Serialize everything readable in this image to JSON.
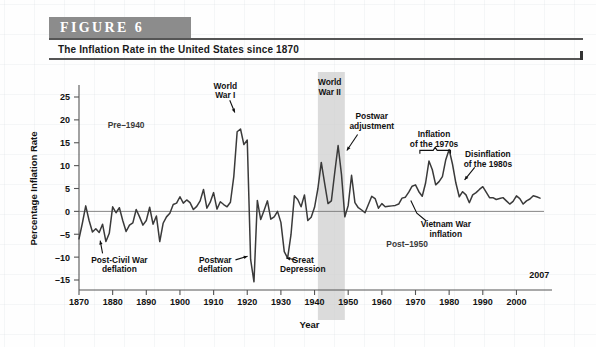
{
  "figure": {
    "badge": "FIGURE  6",
    "title": "The Inflation Rate in the United States since 1870",
    "source": "SOURCE: Constructed by the authors from Commerce Department data since 1929.\nData for 1869–1928 are based on research by Professor Christina Romer."
  },
  "chart_data": {
    "type": "line",
    "title": "The Inflation Rate in the United States since 1870",
    "xlabel": "Year",
    "ylabel": "Percentage Inflation Rate",
    "xlim": [
      1870,
      2007
    ],
    "ylim": [
      -15,
      25
    ],
    "yticks": [
      -15,
      -10,
      -5,
      0,
      5,
      10,
      15,
      20,
      25
    ],
    "xticks": [
      1870,
      1880,
      1890,
      1900,
      1910,
      1920,
      1930,
      1940,
      1950,
      1960,
      1970,
      1980,
      1990,
      2000
    ],
    "end_year_label": "2007",
    "grid": false,
    "legend": "none",
    "line_color": "#3a3a3a",
    "shaded_band_color": "#cfcfcf",
    "shaded_bands": [
      {
        "label": "World War II",
        "start": 1941,
        "end": 1949
      }
    ],
    "x": [
      1870,
      1871,
      1872,
      1873,
      1874,
      1875,
      1876,
      1877,
      1878,
      1879,
      1880,
      1881,
      1882,
      1883,
      1884,
      1885,
      1886,
      1887,
      1888,
      1889,
      1890,
      1891,
      1892,
      1893,
      1894,
      1895,
      1896,
      1897,
      1898,
      1899,
      1900,
      1901,
      1902,
      1903,
      1904,
      1905,
      1906,
      1907,
      1908,
      1909,
      1910,
      1911,
      1912,
      1913,
      1914,
      1915,
      1916,
      1917,
      1918,
      1919,
      1920,
      1921,
      1922,
      1923,
      1924,
      1925,
      1926,
      1927,
      1928,
      1929,
      1930,
      1931,
      1932,
      1933,
      1934,
      1935,
      1936,
      1937,
      1938,
      1939,
      1940,
      1941,
      1942,
      1943,
      1944,
      1945,
      1946,
      1947,
      1948,
      1949,
      1950,
      1951,
      1952,
      1953,
      1954,
      1955,
      1956,
      1957,
      1958,
      1959,
      1960,
      1961,
      1962,
      1963,
      1964,
      1965,
      1966,
      1967,
      1968,
      1969,
      1970,
      1971,
      1972,
      1973,
      1974,
      1975,
      1976,
      1977,
      1978,
      1979,
      1980,
      1981,
      1982,
      1983,
      1984,
      1985,
      1986,
      1987,
      1988,
      1989,
      1990,
      1991,
      1992,
      1993,
      1994,
      1995,
      1996,
      1997,
      1998,
      1999,
      2000,
      2001,
      2002,
      2003,
      2004,
      2005,
      2006,
      2007
    ],
    "values": [
      -6.0,
      -2.6,
      1.2,
      -2.0,
      -4.5,
      -3.8,
      -4.6,
      -2.8,
      -6.6,
      -4.8,
      1.0,
      -0.3,
      0.8,
      -2.0,
      -4.4,
      -3.0,
      -2.5,
      0.4,
      -1.2,
      -3.0,
      -2.0,
      0.9,
      -2.8,
      -1.0,
      -6.6,
      -2.6,
      -1.2,
      -0.4,
      1.5,
      1.8,
      3.2,
      1.8,
      2.5,
      1.9,
      0.4,
      1.1,
      2.3,
      4.8,
      0.7,
      2.0,
      4.1,
      0.5,
      2.1,
      1.5,
      1.0,
      2.0,
      7.6,
      17.4,
      18.0,
      14.6,
      15.6,
      -10.5,
      -15.4,
      2.4,
      -1.8,
      0.2,
      2.3,
      -1.7,
      -1.2,
      0.0,
      -2.4,
      -8.8,
      -10.2,
      -5.1,
      3.4,
      2.6,
      1.0,
      3.6,
      -2.0,
      -1.3,
      0.9,
      5.0,
      10.7,
      6.1,
      1.7,
      2.3,
      8.5,
      14.4,
      8.1,
      -1.2,
      1.3,
      7.9,
      1.9,
      0.8,
      0.3,
      -0.3,
      1.5,
      3.3,
      2.8,
      0.7,
      1.7,
      1.0,
      1.1,
      1.2,
      1.3,
      1.6,
      2.9,
      3.1,
      4.2,
      5.5,
      5.8,
      4.3,
      3.3,
      6.2,
      11.0,
      9.1,
      5.8,
      6.5,
      7.6,
      11.3,
      13.5,
      10.3,
      6.2,
      3.2,
      4.3,
      3.6,
      1.9,
      3.6,
      4.1,
      4.8,
      5.4,
      4.2,
      3.0,
      3.0,
      2.6,
      2.8,
      3.0,
      2.3,
      1.6,
      2.2,
      3.4,
      2.8,
      1.6,
      2.3,
      2.7,
      3.4,
      3.2,
      2.9
    ]
  },
  "annotations": [
    {
      "id": "pre-1940",
      "text": "Pre–1940"
    },
    {
      "id": "post-civil-war",
      "text": "Post-Civil War\ndeflation"
    },
    {
      "id": "postwar-deflation",
      "text": "Postwar\ndeflation"
    },
    {
      "id": "world-war-i",
      "text": "World\nWar I"
    },
    {
      "id": "great-depression",
      "text": "Great\nDepression"
    },
    {
      "id": "world-war-ii",
      "text": "World\nWar II"
    },
    {
      "id": "postwar-adjustment",
      "text": "Postwar\nadjustment"
    },
    {
      "id": "inflation-1970s",
      "text": "Inflation\nof the 1970s"
    },
    {
      "id": "disinflation-1980s",
      "text": "Disinflation\nof the 1980s"
    },
    {
      "id": "vietnam-war",
      "text": "Vietnam War\ninflation"
    },
    {
      "id": "post-1950",
      "text": "Post–1950"
    }
  ],
  "annotation_lines": {
    "pre_1940": [
      "Pre–1940"
    ],
    "post_civil_war": [
      "Post-Civil War",
      "deflation"
    ],
    "postwar_deflation": [
      "Postwar",
      "deflation"
    ],
    "world_war_i": [
      "World",
      "War I"
    ],
    "great_depression": [
      "Great",
      "Depression"
    ],
    "world_war_ii": [
      "World",
      "War II"
    ],
    "postwar_adjustment": [
      "Postwar",
      "adjustment"
    ],
    "inflation_1970s": [
      "Inflation",
      "of the 1970s"
    ],
    "disinflation_1980s": [
      "Disinflation",
      "of the 1980s"
    ],
    "vietnam_war": [
      "Vietnam War",
      "inflation"
    ],
    "post_1950": [
      "Post–1950"
    ]
  }
}
